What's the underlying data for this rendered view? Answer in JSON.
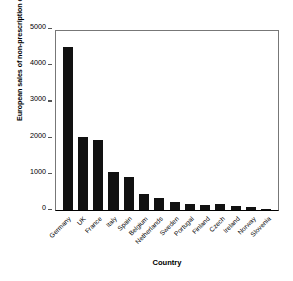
{
  "chart_data": {
    "type": "bar",
    "title": "",
    "xlabel": "Country",
    "ylabel": "European sales of non-prescription drugs 1998 (ECU millions)",
    "categories": [
      "Germany",
      "UK",
      "France",
      "Italy",
      "Spain",
      "Belgium",
      "Netherlands",
      "Sweden",
      "Portugal",
      "Finland",
      "Czech",
      "Ireland",
      "Norway",
      "Slovenia"
    ],
    "values": [
      4500,
      2020,
      1930,
      1050,
      900,
      450,
      320,
      230,
      160,
      130,
      165,
      115,
      90,
      30
    ],
    "ylim": [
      0,
      5000
    ],
    "yticks": [
      0,
      1000,
      2000,
      3000,
      4000,
      5000
    ],
    "ytick_labels": [
      "0",
      "1000",
      "2000",
      "3000",
      "4000",
      "5000"
    ],
    "grid": false,
    "legend": null,
    "bar_color": "#111111",
    "axis_color": "#777777"
  }
}
